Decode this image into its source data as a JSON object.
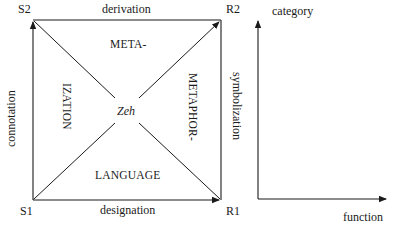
{
  "square": {
    "corners": {
      "top_left": "S2",
      "top_right": "R2",
      "bottom_left": "S1",
      "bottom_right": "R1"
    },
    "edges": {
      "top": "derivation",
      "bottom": "designation",
      "left": "connotation",
      "right": "symbolization"
    },
    "interior": {
      "top": "META-",
      "left": "IZATION",
      "right": "METAPHOR-",
      "bottom": "LANGUAGE",
      "center": "Zeh"
    }
  },
  "axes": {
    "y_label": "category",
    "x_label": "function"
  },
  "colors": {
    "ink": "#1a1a1a",
    "background": "#ffffff"
  }
}
